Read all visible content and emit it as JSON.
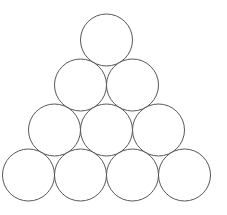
{
  "figure": {
    "name": "triangular-circle-packing",
    "canvas": {
      "width": 227,
      "height": 215
    },
    "background_color": "#ffffff",
    "stroke_color": "#585858",
    "fill_color": "#ffffff",
    "stroke_width": 1,
    "circle_count": 10,
    "row_count": 4,
    "radius": 26,
    "diameter": 52,
    "row_spacing": 45
  },
  "chart_data": {
    "type": "scatter",
    "xlabel": "",
    "ylabel": "",
    "xlim": [
      0,
      227
    ],
    "ylim": [
      0,
      215
    ],
    "grid": false,
    "legend": "none",
    "marker": "circle-outline",
    "marker_radius": 26,
    "rows": [
      {
        "index": 1,
        "count": 1,
        "cy": 40,
        "cx": [
          106.5
        ]
      },
      {
        "index": 2,
        "count": 2,
        "cy": 85,
        "cx": [
          80.5,
          132.5
        ]
      },
      {
        "index": 3,
        "count": 3,
        "cy": 130,
        "cx": [
          54.5,
          106.5,
          158.5
        ]
      },
      {
        "index": 4,
        "count": 4,
        "cy": 175,
        "cx": [
          28.5,
          80.5,
          132.5,
          184.5
        ]
      }
    ],
    "circles": [
      {
        "id": "r1c1",
        "row": 1,
        "col": 1,
        "cx": 106.5,
        "cy": 40,
        "r": 26
      },
      {
        "id": "r2c1",
        "row": 2,
        "col": 1,
        "cx": 80.5,
        "cy": 85,
        "r": 26
      },
      {
        "id": "r2c2",
        "row": 2,
        "col": 2,
        "cx": 132.5,
        "cy": 85,
        "r": 26
      },
      {
        "id": "r3c1",
        "row": 3,
        "col": 1,
        "cx": 54.5,
        "cy": 130,
        "r": 26
      },
      {
        "id": "r3c2",
        "row": 3,
        "col": 2,
        "cx": 106.5,
        "cy": 130,
        "r": 26
      },
      {
        "id": "r3c3",
        "row": 3,
        "col": 3,
        "cx": 158.5,
        "cy": 130,
        "r": 26
      },
      {
        "id": "r4c1",
        "row": 4,
        "col": 1,
        "cx": 28.5,
        "cy": 175,
        "r": 26
      },
      {
        "id": "r4c2",
        "row": 4,
        "col": 2,
        "cx": 80.5,
        "cy": 175,
        "r": 26
      },
      {
        "id": "r4c3",
        "row": 4,
        "col": 3,
        "cx": 132.5,
        "cy": 175,
        "r": 26
      },
      {
        "id": "r4c4",
        "row": 4,
        "col": 4,
        "cx": 184.5,
        "cy": 175,
        "r": 26
      }
    ]
  }
}
